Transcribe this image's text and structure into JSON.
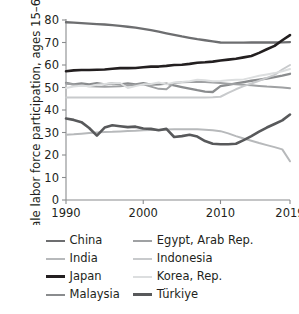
{
  "chart_data": {
    "type": "line",
    "title": "",
    "xlabel": "",
    "ylabel": "Female labor force participation, ages 15–64 (%)",
    "xlim": [
      1990,
      2019
    ],
    "ylim": [
      0,
      80
    ],
    "yticks": [
      0,
      10,
      20,
      30,
      40,
      50,
      60,
      70,
      80
    ],
    "xticks": [
      1990,
      2000,
      2010,
      2019
    ],
    "grid": false,
    "legend_position": "bottom",
    "x": [
      1990,
      1991,
      1992,
      1993,
      1994,
      1995,
      1996,
      1997,
      1998,
      1999,
      2000,
      2001,
      2002,
      2003,
      2004,
      2005,
      2006,
      2007,
      2008,
      2009,
      2010,
      2011,
      2012,
      2013,
      2014,
      2015,
      2016,
      2017,
      2018,
      2019
    ],
    "series": [
      {
        "name": "China",
        "color": "#6d6e70",
        "width": 2.3,
        "values": [
          79.0,
          78.8,
          78.6,
          78.4,
          78.2,
          78.0,
          77.7,
          77.4,
          77.0,
          76.6,
          76.1,
          75.5,
          74.8,
          74.1,
          73.4,
          72.7,
          72.1,
          71.5,
          71.0,
          70.5,
          70.0,
          69.9,
          69.9,
          69.9,
          70.0,
          70.0,
          70.0,
          70.0,
          70.1,
          70.2
        ]
      },
      {
        "name": "India",
        "color": "#b7b9bb",
        "width": 2.0,
        "values": [
          29.0,
          29.2,
          29.5,
          29.8,
          30.0,
          30.2,
          30.3,
          30.5,
          30.7,
          30.8,
          31.0,
          31.1,
          31.2,
          31.3,
          31.4,
          31.5,
          31.5,
          31.4,
          31.2,
          31.0,
          30.6,
          29.6,
          28.4,
          27.3,
          26.3,
          25.3,
          24.4,
          23.5,
          22.5,
          17.2
        ]
      },
      {
        "name": "Japan",
        "color": "#231f20",
        "width": 2.6,
        "values": [
          57.2,
          57.6,
          57.8,
          57.8,
          57.9,
          58.0,
          58.3,
          58.6,
          58.6,
          58.7,
          59.0,
          59.3,
          59.3,
          59.6,
          60.0,
          60.1,
          60.5,
          61.0,
          61.2,
          61.5,
          62.0,
          62.4,
          62.8,
          63.4,
          64.0,
          65.4,
          67.0,
          68.5,
          71.0,
          73.3
        ]
      },
      {
        "name": "Malaysia",
        "color": "#8a8c8e",
        "width": 2.3,
        "values": [
          52.0,
          51.4,
          51.8,
          51.4,
          51.9,
          51.4,
          51.8,
          51.4,
          51.8,
          51.4,
          51.9,
          51.3,
          51.4,
          51.7,
          50.9,
          50.2,
          49.5,
          48.8,
          48.2,
          48.0,
          50.6,
          51.2,
          51.8,
          52.4,
          53.0,
          53.5,
          54.0,
          54.6,
          55.3,
          56.1
        ]
      },
      {
        "name": "Egypt, Arab Rep.",
        "color": "#9fa1a3",
        "width": 2.0,
        "values": [
          51.8,
          51.3,
          50.9,
          50.6,
          50.4,
          50.3,
          50.4,
          50.6,
          50.9,
          51.2,
          51.4,
          50.4,
          49.4,
          49.2,
          52.0,
          52.3,
          52.5,
          52.6,
          52.4,
          52.2,
          52.0,
          51.7,
          51.4,
          51.2,
          51.0,
          50.7,
          50.4,
          50.2,
          50.0,
          49.7
        ]
      },
      {
        "name": "Indonesia",
        "color": "#c8cacc",
        "width": 2.0,
        "values": [
          45.6,
          45.6,
          45.6,
          45.6,
          45.6,
          45.6,
          45.6,
          45.6,
          45.6,
          45.6,
          45.6,
          45.6,
          45.6,
          45.6,
          45.6,
          45.6,
          45.6,
          45.6,
          45.6,
          45.7,
          45.9,
          47.6,
          49.2,
          50.6,
          51.8,
          53.0,
          54.3,
          55.6,
          58.0,
          60.0
        ]
      },
      {
        "name": "Korea, Rep.",
        "color": "#dcdedf",
        "width": 2.0,
        "values": [
          49.8,
          50.4,
          50.8,
          50.6,
          51.2,
          51.6,
          51.9,
          52.0,
          49.8,
          50.6,
          51.4,
          51.6,
          52.2,
          51.4,
          52.2,
          52.4,
          52.8,
          53.4,
          53.2,
          52.8,
          52.9,
          53.2,
          53.5,
          53.6,
          54.4,
          55.2,
          55.8,
          56.4,
          57.2,
          58.2
        ]
      },
      {
        "name": "Türkiye",
        "color": "#58595b",
        "width": 2.6,
        "values": [
          36.2,
          35.6,
          34.6,
          32.0,
          28.6,
          32.2,
          33.2,
          32.8,
          32.4,
          32.6,
          31.8,
          31.6,
          31.0,
          31.6,
          28.0,
          28.4,
          29.0,
          28.2,
          26.2,
          25.0,
          24.8,
          24.8,
          25.0,
          26.6,
          28.4,
          30.4,
          32.2,
          33.8,
          35.4,
          38.0
        ]
      }
    ]
  },
  "legend": {
    "entries": [
      {
        "label": "China",
        "color": "#6d6e70",
        "width": 2.6
      },
      {
        "label": "Egypt, Arab Rep.",
        "color": "#9fa1a3",
        "width": 2.2
      },
      {
        "label": "India",
        "color": "#b7b9bb",
        "width": 2.2
      },
      {
        "label": "Indonesia",
        "color": "#c8cacc",
        "width": 2.2
      },
      {
        "label": "Japan",
        "color": "#231f20",
        "width": 3.0
      },
      {
        "label": "Korea, Rep.",
        "color": "#dcdedf",
        "width": 2.2
      },
      {
        "label": "Malaysia",
        "color": "#8a8c8e",
        "width": 2.4
      },
      {
        "label": "Türkiye",
        "color": "#58595b",
        "width": 3.0
      }
    ]
  },
  "axes": {
    "y_title": "Female labor force participation, ages 15–64 (%)",
    "y_tick_labels": [
      "0",
      "10",
      "20",
      "30",
      "40",
      "50",
      "60",
      "70",
      "80"
    ],
    "x_tick_labels": [
      "1990",
      "2000",
      "2010",
      "2019"
    ],
    "axis_color": "#8a8c8e"
  }
}
